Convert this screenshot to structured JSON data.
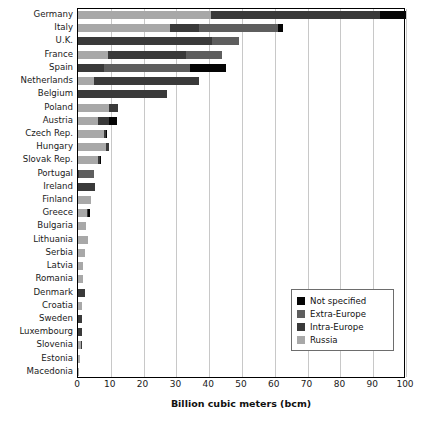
{
  "chart_data": {
    "type": "bar",
    "orientation": "horizontal",
    "stacked": true,
    "title": "",
    "xlabel": "Billion cubic meters (bcm)",
    "ylabel": "",
    "xlim": [
      0,
      100
    ],
    "xticks": [
      0,
      10,
      20,
      30,
      40,
      50,
      60,
      70,
      80,
      90,
      100
    ],
    "grid": "vertical",
    "legend_position": "bottom-right",
    "legend": [
      "Not specified",
      "Extra-Europe",
      "Intra-Europe",
      "Russia"
    ],
    "series_order": [
      "Russia",
      "Intra-Europe",
      "Extra-Europe",
      "Not specified"
    ],
    "colors": {
      "Not specified": "#050505",
      "Extra-Europe": "#5e5e5e",
      "Intra-Europe": "#3a3a3a",
      "Russia": "#a8a8a8"
    },
    "categories": [
      "Germany",
      "Italy",
      "U.K.",
      "France",
      "Spain",
      "Netherlands",
      "Belgium",
      "Poland",
      "Austria",
      "Czech Rep.",
      "Hungary",
      "Slovak Rep.",
      "Portugal",
      "Ireland",
      "Finland",
      "Greece",
      "Bulgaria",
      "Lithuania",
      "Serbia",
      "Latvia",
      "Romania",
      "Denmark",
      "Croatia",
      "Sweden",
      "Luxembourg",
      "Slovenia",
      "Estonia",
      "Macedonia"
    ],
    "series": [
      {
        "name": "Russia",
        "values": [
          40.5,
          28.0,
          0.0,
          9.0,
          0.0,
          5.0,
          0.0,
          9.5,
          6.0,
          8.0,
          8.5,
          6.0,
          0.0,
          0.0,
          4.0,
          2.8,
          2.5,
          3.0,
          2.2,
          1.6,
          1.4,
          0.0,
          1.1,
          0.0,
          0.0,
          0.8,
          0.7,
          0.1
        ]
      },
      {
        "name": "Intra-Europe",
        "values": [
          51.5,
          9.0,
          41.0,
          24.0,
          8.0,
          32.0,
          27.0,
          2.6,
          3.5,
          0.5,
          1.0,
          0.6,
          0.3,
          5.3,
          0.0,
          0.3,
          0.0,
          0.0,
          0.0,
          0.0,
          0.0,
          2.0,
          0.0,
          1.1,
          1.1,
          0.3,
          0.0,
          0.0
        ]
      },
      {
        "name": "Extra-Europe",
        "values": [
          0.0,
          24.0,
          8.0,
          11.0,
          26.0,
          0.0,
          0.0,
          0.0,
          0.0,
          0.0,
          0.0,
          0.0,
          4.7,
          0.0,
          0.0,
          0.0,
          0.0,
          0.0,
          0.0,
          0.0,
          0.0,
          0.0,
          0.0,
          0.0,
          0.0,
          0.0,
          0.0,
          0.0
        ]
      },
      {
        "name": "Not specified",
        "values": [
          8.0,
          1.5,
          0.0,
          0.0,
          11.0,
          0.0,
          0.0,
          0.0,
          2.5,
          0.3,
          0.0,
          0.4,
          0.0,
          0.0,
          0.0,
          0.6,
          0.0,
          0.0,
          0.0,
          0.0,
          0.0,
          0.0,
          0.0,
          0.0,
          0.0,
          0.0,
          0.0,
          0.0
        ]
      }
    ],
    "totals": [
      100.0,
      62.5,
      49.0,
      44.0,
      45.0,
      37.0,
      27.0,
      12.1,
      12.0,
      8.8,
      9.5,
      7.0,
      5.0,
      5.3,
      4.0,
      3.7,
      2.5,
      3.0,
      2.2,
      1.6,
      1.4,
      2.0,
      1.1,
      1.1,
      1.1,
      1.1,
      0.7,
      0.1
    ]
  },
  "axis": {
    "x_title": "Billion cubic meters (bcm)",
    "tick_labels": [
      "0",
      "10",
      "20",
      "30",
      "40",
      "50",
      "60",
      "70",
      "80",
      "90",
      "100"
    ]
  },
  "legend": {
    "items": [
      {
        "label": "Not specified",
        "color": "#050505",
        "swatch_name": "legend-swatch-not-specified"
      },
      {
        "label": "Extra-Europe",
        "color": "#5e5e5e",
        "swatch_name": "legend-swatch-extra-europe"
      },
      {
        "label": "Intra-Europe",
        "color": "#3a3a3a",
        "swatch_name": "legend-swatch-intra-europe"
      },
      {
        "label": "Russia",
        "color": "#a8a8a8",
        "swatch_name": "legend-swatch-russia"
      }
    ]
  }
}
